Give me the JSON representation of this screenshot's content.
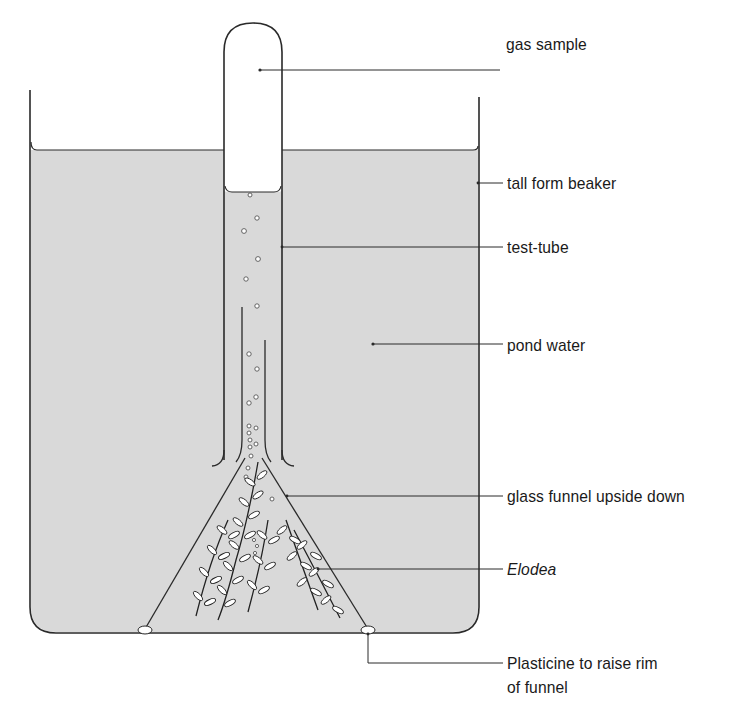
{
  "diagram": {
    "colors": {
      "water": "#d9d9d9",
      "line": "#2a2a2a",
      "background": "#ffffff"
    },
    "labels": [
      {
        "id": "gas-sample",
        "text": "gas sample"
      },
      {
        "id": "tall-form-beaker",
        "text": "tall form beaker"
      },
      {
        "id": "test-tube",
        "text": "test-tube"
      },
      {
        "id": "pond-water",
        "text": "pond water"
      },
      {
        "id": "glass-funnel",
        "text": "glass funnel upside down"
      },
      {
        "id": "elodea",
        "text": "Elodea",
        "style": "italic"
      },
      {
        "id": "plasticine",
        "text": "Plasticine to raise rim",
        "text_line2": "of funnel"
      }
    ]
  }
}
